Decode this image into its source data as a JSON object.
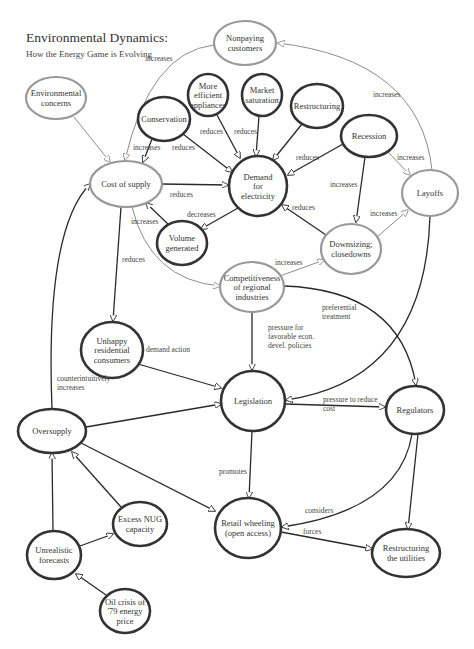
{
  "header": {
    "title": "Environmental Dynamics:",
    "subtitle": "How the Energy Game is Evolving"
  },
  "colors": {
    "gray_node": "#999999",
    "dark_node": "#333333",
    "gray_edge": "#8c8c8c",
    "dark_edge": "#2a2a2a"
  },
  "nodes": [
    {
      "id": "nonpaying",
      "lines": [
        "Nonpaying",
        "customers"
      ],
      "cx": 245,
      "cy": 43,
      "rx": 31,
      "ry": 22,
      "style": "gray"
    },
    {
      "id": "env",
      "lines": [
        "Environmental",
        "concerns"
      ],
      "cx": 56,
      "cy": 98,
      "rx": 30,
      "ry": 21,
      "style": "gray"
    },
    {
      "id": "efficient",
      "lines": [
        "More",
        "efficient",
        "appliances"
      ],
      "cx": 208,
      "cy": 95,
      "rx": 20,
      "ry": 21,
      "style": "dark"
    },
    {
      "id": "market",
      "lines": [
        "Market",
        "saturation"
      ],
      "cx": 262,
      "cy": 95,
      "rx": 20,
      "ry": 21,
      "style": "dark"
    },
    {
      "id": "restructuring",
      "lines": [
        "Restructuring"
      ],
      "cx": 317,
      "cy": 106,
      "rx": 26,
      "ry": 22,
      "style": "dark"
    },
    {
      "id": "conservation",
      "lines": [
        "Conservation"
      ],
      "cx": 164,
      "cy": 119,
      "rx": 26,
      "ry": 22,
      "style": "dark"
    },
    {
      "id": "recession",
      "lines": [
        "Recession"
      ],
      "cx": 369,
      "cy": 136,
      "rx": 28,
      "ry": 21,
      "style": "dark"
    },
    {
      "id": "cost",
      "lines": [
        "Cost of supply"
      ],
      "cx": 126,
      "cy": 184,
      "rx": 36,
      "ry": 23,
      "style": "gray"
    },
    {
      "id": "demand",
      "lines": [
        "Demand",
        "for",
        "electricity"
      ],
      "cx": 258,
      "cy": 186,
      "rx": 29,
      "ry": 30,
      "style": "dark"
    },
    {
      "id": "layoffs",
      "lines": [
        "Layoffs"
      ],
      "cx": 430,
      "cy": 193,
      "rx": 28,
      "ry": 23,
      "style": "gray"
    },
    {
      "id": "volume",
      "lines": [
        "Volume",
        "generated"
      ],
      "cx": 182,
      "cy": 243,
      "rx": 25,
      "ry": 22,
      "style": "dark"
    },
    {
      "id": "downsizing",
      "lines": [
        "Downsizing;",
        "closedowns"
      ],
      "cx": 351,
      "cy": 249,
      "rx": 30,
      "ry": 25,
      "style": "gray"
    },
    {
      "id": "competitive",
      "lines": [
        "Competitiveness",
        "of regional",
        "industries"
      ],
      "cx": 252,
      "cy": 287,
      "rx": 32,
      "ry": 25,
      "style": "gray"
    },
    {
      "id": "unhappy",
      "lines": [
        "Unhappy",
        "residential",
        "consumers"
      ],
      "cx": 112,
      "cy": 350,
      "rx": 31,
      "ry": 28,
      "style": "dark"
    },
    {
      "id": "legislation",
      "lines": [
        "Legislation"
      ],
      "cx": 253,
      "cy": 401,
      "rx": 32,
      "ry": 30,
      "style": "dark"
    },
    {
      "id": "regulators",
      "lines": [
        "Regulators"
      ],
      "cx": 415,
      "cy": 410,
      "rx": 29,
      "ry": 24,
      "style": "dark"
    },
    {
      "id": "oversupply",
      "lines": [
        "Oversupply"
      ],
      "cx": 52,
      "cy": 431,
      "rx": 34,
      "ry": 22,
      "style": "dark"
    },
    {
      "id": "nug",
      "lines": [
        "Excess NUG",
        "capacity"
      ],
      "cx": 140,
      "cy": 524,
      "rx": 27,
      "ry": 22,
      "style": "dark"
    },
    {
      "id": "retail",
      "lines": [
        "Retail wheeling",
        "(open access)"
      ],
      "cx": 248,
      "cy": 528,
      "rx": 33,
      "ry": 30,
      "style": "dark"
    },
    {
      "id": "forecasts",
      "lines": [
        "Unrealistic",
        "forecasts"
      ],
      "cx": 54,
      "cy": 555,
      "rx": 27,
      "ry": 24,
      "style": "dark"
    },
    {
      "id": "restructuring_util",
      "lines": [
        "Restructuring",
        "the utilities"
      ],
      "cx": 406,
      "cy": 553,
      "rx": 34,
      "ry": 24,
      "style": "dark"
    },
    {
      "id": "oilcrisis",
      "lines": [
        "Oil crisis of",
        "'79 energy",
        "price"
      ],
      "cx": 125,
      "cy": 611,
      "rx": 25,
      "ry": 22,
      "style": "dark"
    }
  ],
  "edges": [
    {
      "id": "env-cost",
      "d": "M 74 117 L 110 162",
      "style": "gray",
      "label": "",
      "lx": 0,
      "ly": 0
    },
    {
      "id": "nonpaying-cost",
      "d": "M 214 45 Q 150 52 125 160",
      "style": "gray",
      "label": "increases",
      "lx": 145,
      "ly": 61
    },
    {
      "id": "conservation-cost",
      "d": "M 152 139 L 143 162",
      "style": "dark",
      "label": "increases",
      "lx": 133,
      "ly": 150
    },
    {
      "id": "conservation-demand",
      "d": "M 183 134 L 232 172",
      "style": "dark",
      "label": "reduces",
      "lx": 172,
      "ly": 150
    },
    {
      "id": "efficient-demand",
      "d": "M 217 115 L 240 158",
      "style": "dark",
      "label": "reduces",
      "lx": 200,
      "ly": 134
    },
    {
      "id": "market-demand",
      "d": "M 259 116 L 256 156",
      "style": "dark",
      "label": "reduces",
      "lx": 234,
      "ly": 134
    },
    {
      "id": "restructuring-demand",
      "d": "M 302 124 L 273 160",
      "style": "dark",
      "label": "",
      "lx": 0,
      "ly": 0
    },
    {
      "id": "recession-demand",
      "d": "M 343 144 L 288 175",
      "style": "dark",
      "label": "reduces",
      "lx": 296,
      "ly": 160
    },
    {
      "id": "recession-layoffs",
      "d": "M 388 152 L 410 175",
      "style": "gray",
      "label": "increases",
      "lx": 397,
      "ly": 160
    },
    {
      "id": "recession-downsizing",
      "d": "M 365 157 L 356 222",
      "style": "dark",
      "label": "increases",
      "lx": 330,
      "ly": 187
    },
    {
      "id": "layoffs-nonpaying",
      "d": "M 432 170 Q 420 60 278 43",
      "style": "gray",
      "label": "increases",
      "lx": 373,
      "ly": 97
    },
    {
      "id": "cost-demand",
      "d": "M 162 184 L 228 185",
      "style": "dark",
      "label": "reduces",
      "lx": 170,
      "ly": 197
    },
    {
      "id": "demand-volume",
      "d": "M 238 208 L 201 229",
      "style": "dark",
      "label": "decreases",
      "lx": 187,
      "ly": 217
    },
    {
      "id": "volume-cost",
      "d": "M 168 224 L 146 203",
      "style": "dark",
      "label": "increases",
      "lx": 131,
      "ly": 224
    },
    {
      "id": "downsizing-demand",
      "d": "M 326 235 L 282 205",
      "style": "dark",
      "label": "reduces",
      "lx": 292,
      "ly": 210
    },
    {
      "id": "downsizing-layoffs",
      "d": "M 376 238 L 408 210",
      "style": "gray",
      "label": "increases",
      "lx": 370,
      "ly": 216
    },
    {
      "id": "competitive-downsizing",
      "d": "M 280 276 L 324 260",
      "style": "gray",
      "label": "increases",
      "lx": 275,
      "ly": 265
    },
    {
      "id": "cost-competitive",
      "d": "M 132 207 Q 150 280 220 286",
      "style": "gray",
      "label": "",
      "lx": 0,
      "ly": 0
    },
    {
      "id": "cost-unhappy",
      "d": "M 121 207 L 113 321",
      "style": "dark",
      "label": "reduces",
      "lx": 122,
      "ly": 262
    },
    {
      "id": "competitive-legislation",
      "d": "M 252 312 L 252 370",
      "style": "dark",
      "label": "pressure for|favorable econ.|devel. policies",
      "lx": 268,
      "ly": 330
    },
    {
      "id": "competitive-regulators",
      "d": "M 284 286 Q 400 290 416 385",
      "style": "dark",
      "label": "preferential|treatment",
      "lx": 322,
      "ly": 310
    },
    {
      "id": "layoffs-legislation",
      "d": "M 430 216 Q 425 380 286 400",
      "style": "dark",
      "label": "",
      "lx": 0,
      "ly": 0
    },
    {
      "id": "unhappy-legislation",
      "d": "M 138 364 L 221 388",
      "style": "dark",
      "label": "demand action",
      "lx": 146,
      "ly": 352
    },
    {
      "id": "oversupply-legislation",
      "d": "M 86 427 L 221 404",
      "style": "dark",
      "label": "",
      "lx": 0,
      "ly": 0
    },
    {
      "id": "legislation-regulators",
      "d": "M 285 404 L 385 407",
      "style": "dark",
      "label": "pressure to reduce|cost",
      "lx": 323,
      "ly": 402
    },
    {
      "id": "oversupply-cost",
      "d": "M 52 409 Q 45 230 90 184",
      "style": "dark",
      "label": "counterintuitively|increases",
      "lx": 57,
      "ly": 381
    },
    {
      "id": "legislation-retail",
      "d": "M 252 431 L 249 498",
      "style": "dark",
      "label": "promotes",
      "lx": 219,
      "ly": 474
    },
    {
      "id": "oversupply-retail",
      "d": "M 81 443 L 215 511",
      "style": "dark",
      "label": "",
      "lx": 0,
      "ly": 0
    },
    {
      "id": "regulators-retail",
      "d": "M 412 434 Q 400 510 282 527",
      "style": "dark",
      "label": "considers",
      "lx": 305,
      "ly": 513
    },
    {
      "id": "regulators-restructuring",
      "d": "M 418 434 L 408 529",
      "style": "dark",
      "label": "",
      "lx": 0,
      "ly": 0
    },
    {
      "id": "retail-restructuring",
      "d": "M 281 532 L 372 549",
      "style": "dark",
      "label": "forces",
      "lx": 303,
      "ly": 534
    },
    {
      "id": "nug-oversupply",
      "d": "M 121 507 L 72 452",
      "style": "dark",
      "label": "",
      "lx": 0,
      "ly": 0
    },
    {
      "id": "forecasts-oversupply",
      "d": "M 53 531 L 52 453",
      "style": "dark",
      "label": "",
      "lx": 0,
      "ly": 0
    },
    {
      "id": "forecasts-nug",
      "d": "M 80 546 L 113 534",
      "style": "dark",
      "label": "",
      "lx": 0,
      "ly": 0
    },
    {
      "id": "oilcrisis-forecasts",
      "d": "M 106 595 L 76 574",
      "style": "dark",
      "label": "",
      "lx": 0,
      "ly": 0
    }
  ]
}
